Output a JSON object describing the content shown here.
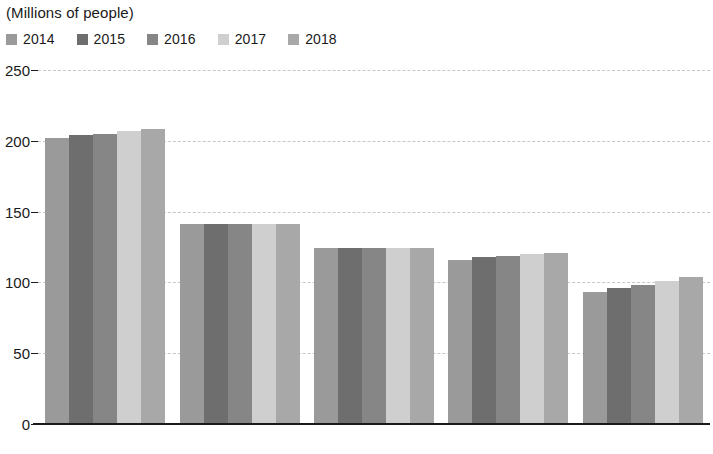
{
  "axis_unit_label": "(Millions of people)",
  "legend": {
    "items": [
      {
        "label": "2014",
        "color": "#9a9a9a"
      },
      {
        "label": "2015",
        "color": "#6e6e6e"
      },
      {
        "label": "2016",
        "color": "#868686"
      },
      {
        "label": "2017",
        "color": "#cfcfcf"
      },
      {
        "label": "2018",
        "color": "#a8a8a8"
      }
    ]
  },
  "chart_data": {
    "type": "bar",
    "title": "",
    "subtitle": "",
    "xlabel": "",
    "ylabel": "(Millions of people)",
    "ylim": [
      0,
      250
    ],
    "yticks": [
      0,
      50,
      100,
      150,
      200,
      250
    ],
    "ytick_labels": [
      "0",
      "50",
      "100",
      "150",
      "200",
      "250"
    ],
    "grid": true,
    "legend_position": "top-left",
    "categories": [
      "Brazil",
      "Russia",
      "Japan",
      "Mexico",
      "Ethiopia"
    ],
    "series": [
      {
        "name": "2014",
        "color": "#9a9a9a",
        "values": [
          202,
          141,
          124,
          116,
          93
        ]
      },
      {
        "name": "2015",
        "color": "#6e6e6e",
        "values": [
          204,
          141,
          124,
          118,
          96
        ]
      },
      {
        "name": "2016",
        "color": "#868686",
        "values": [
          205,
          141,
          124,
          119,
          98
        ]
      },
      {
        "name": "2017",
        "color": "#cfcfcf",
        "values": [
          207,
          141,
          124,
          120,
          101
        ]
      },
      {
        "name": "2018",
        "color": "#a8a8a8",
        "values": [
          208,
          141,
          124,
          121,
          104
        ]
      }
    ]
  }
}
